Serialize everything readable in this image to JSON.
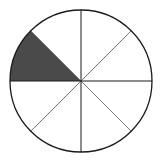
{
  "diagram": {
    "type": "fraction-circle",
    "total_parts": 8,
    "shaded_parts": 1,
    "shaded_sector_index": 3,
    "fraction_shaded": "1/8",
    "colors": {
      "background": "#ffffff",
      "outline": "#1a1a1a",
      "axis_lines": "#1a1a1a",
      "diagonal_lines": "#7a7a7a",
      "shade": "#4a4a4a"
    }
  }
}
